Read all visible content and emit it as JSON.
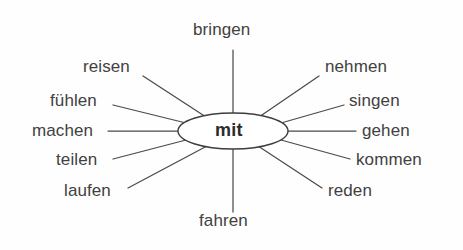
{
  "diagram": {
    "type": "word-web",
    "center": {
      "label": "mit",
      "shape": "ellipse",
      "cx": 233,
      "cy": 131,
      "rx": 55,
      "ry": 18
    },
    "style": {
      "background_color": "#fefefe",
      "line_color": "#4a4a4a",
      "text_color": "#414141",
      "center_text_color": "#2b2b2b",
      "center_fill": "#ffffff"
    },
    "nodes": [
      {
        "label": "bringen",
        "position": "top",
        "label_x": 193,
        "label_y": 20,
        "line": {
          "x1": 233,
          "y1": 50,
          "x2": 233,
          "y2": 113
        }
      },
      {
        "label": "reisen",
        "position": "upper-left",
        "label_x": 83,
        "label_y": 57,
        "line": {
          "x1": 143,
          "y1": 76,
          "x2": 206,
          "y2": 117
        }
      },
      {
        "label": "nehmen",
        "position": "upper-right",
        "label_x": 325,
        "label_y": 57,
        "line": {
          "x1": 319,
          "y1": 76,
          "x2": 259,
          "y2": 117
        }
      },
      {
        "label": "fühlen",
        "position": "left-upper",
        "label_x": 50,
        "label_y": 91,
        "line": {
          "x1": 113,
          "y1": 105,
          "x2": 186,
          "y2": 123
        }
      },
      {
        "label": "singen",
        "position": "right-upper",
        "label_x": 349,
        "label_y": 91,
        "line": {
          "x1": 344,
          "y1": 105,
          "x2": 281,
          "y2": 123
        }
      },
      {
        "label": "machen",
        "position": "left",
        "label_x": 32,
        "label_y": 121,
        "line": {
          "x1": 108,
          "y1": 131,
          "x2": 178,
          "y2": 131
        }
      },
      {
        "label": "gehen",
        "position": "right",
        "label_x": 362,
        "label_y": 121,
        "line": {
          "x1": 288,
          "y1": 131,
          "x2": 356,
          "y2": 131
        }
      },
      {
        "label": "teilen",
        "position": "left-lower",
        "label_x": 56,
        "label_y": 150,
        "line": {
          "x1": 113,
          "y1": 159,
          "x2": 186,
          "y2": 140
        }
      },
      {
        "label": "kommen",
        "position": "right-lower",
        "label_x": 356,
        "label_y": 150,
        "line": {
          "x1": 350,
          "y1": 159,
          "x2": 281,
          "y2": 140
        }
      },
      {
        "label": "laufen",
        "position": "lower-left",
        "label_x": 64,
        "label_y": 181,
        "line": {
          "x1": 128,
          "y1": 188,
          "x2": 207,
          "y2": 146
        }
      },
      {
        "label": "reden",
        "position": "lower-right",
        "label_x": 328,
        "label_y": 181,
        "line": {
          "x1": 322,
          "y1": 188,
          "x2": 258,
          "y2": 146
        }
      },
      {
        "label": "fahren",
        "position": "bottom",
        "label_x": 199,
        "label_y": 211,
        "line": {
          "x1": 233,
          "y1": 149,
          "x2": 233,
          "y2": 212
        }
      }
    ]
  }
}
